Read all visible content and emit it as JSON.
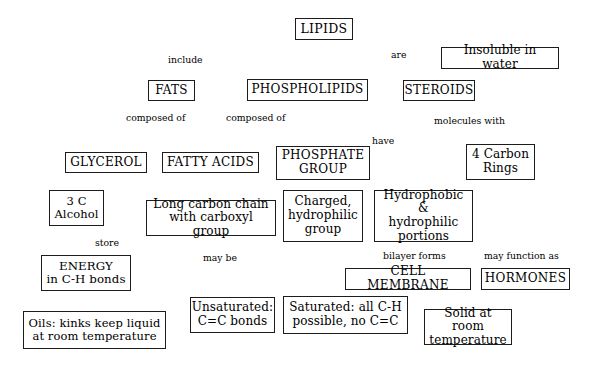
{
  "diagram": {
    "type": "concept-map",
    "canvas": {
      "width": 593,
      "height": 372
    },
    "style": {
      "background": "#ffffff",
      "stroke": "#1c1c1c",
      "text": "#000000"
    },
    "nodes": [
      {
        "id": "lipids",
        "label": "LIPIDS",
        "x": 295,
        "y": 18,
        "w": 58,
        "h": 22,
        "font": 12.5,
        "caps": true
      },
      {
        "id": "insoluble",
        "label": "Insoluble in water",
        "x": 441,
        "y": 47,
        "w": 118,
        "h": 22,
        "font": 12,
        "caps": false
      },
      {
        "id": "fats",
        "label": "FATS",
        "x": 148,
        "y": 80,
        "w": 47,
        "h": 21,
        "font": 12,
        "caps": true
      },
      {
        "id": "phospholipids",
        "label": "PHOSPHOLIPIDS",
        "x": 247,
        "y": 79,
        "w": 121,
        "h": 22,
        "font": 12,
        "caps": true
      },
      {
        "id": "steroids",
        "label": "STEROIDS",
        "x": 403,
        "y": 80,
        "w": 72,
        "h": 21,
        "font": 12,
        "caps": true
      },
      {
        "id": "glycerol",
        "label": "GLYCEROL",
        "x": 65,
        "y": 152,
        "w": 82,
        "h": 21,
        "font": 12,
        "caps": true
      },
      {
        "id": "fattyacids",
        "label": "FATTY ACIDS",
        "x": 162,
        "y": 152,
        "w": 97,
        "h": 21,
        "font": 12,
        "caps": true
      },
      {
        "id": "phosphate",
        "label": "PHOSPHATE\nGROUP",
        "x": 276,
        "y": 146,
        "w": 94,
        "h": 34,
        "font": 12,
        "caps": true
      },
      {
        "id": "fourcarbon",
        "label": "4 Carbon\nRings",
        "x": 466,
        "y": 144,
        "w": 69,
        "h": 36,
        "font": 12,
        "caps": false
      },
      {
        "id": "threec",
        "label": "3 C\nAlcohol",
        "x": 49,
        "y": 190,
        "w": 55,
        "h": 36,
        "font": 11.5,
        "caps": false
      },
      {
        "id": "longchain",
        "label": "Long carbon chain\nwith carboxyl group",
        "x": 146,
        "y": 200,
        "w": 130,
        "h": 36,
        "font": 12,
        "caps": false
      },
      {
        "id": "charged",
        "label": "Charged,\nhydrophilic\ngroup",
        "x": 283,
        "y": 190,
        "w": 80,
        "h": 52,
        "font": 12,
        "caps": false
      },
      {
        "id": "hydro",
        "label": "Hydrophobic &\nhydrophilic\nportions",
        "x": 374,
        "y": 190,
        "w": 99,
        "h": 52,
        "font": 12,
        "caps": false
      },
      {
        "id": "energy",
        "label": "ENERGY\nin C-H bonds",
        "x": 41,
        "y": 255,
        "w": 90,
        "h": 36,
        "font": 11.8,
        "caps": false
      },
      {
        "id": "cellmembrane",
        "label": "CELL MEMBRANE",
        "x": 345,
        "y": 268,
        "w": 126,
        "h": 22,
        "font": 12,
        "caps": true
      },
      {
        "id": "hormones",
        "label": "HORMONES",
        "x": 481,
        "y": 268,
        "w": 89,
        "h": 22,
        "font": 12,
        "caps": true
      },
      {
        "id": "unsaturated",
        "label": "Unsaturated:\nC=C bonds",
        "x": 190,
        "y": 297,
        "w": 85,
        "h": 36,
        "font": 12,
        "caps": false
      },
      {
        "id": "saturated",
        "label": "Saturated:  all C-H\npossible, no C=C",
        "x": 283,
        "y": 296,
        "w": 125,
        "h": 38,
        "font": 12,
        "caps": false
      },
      {
        "id": "oils",
        "label": "Oils: kinks keep liquid\nat room temperature",
        "x": 23,
        "y": 311,
        "w": 143,
        "h": 38,
        "font": 11.5,
        "caps": false
      },
      {
        "id": "solid",
        "label": "Solid at room\ntemperature",
        "x": 424,
        "y": 309,
        "w": 88,
        "h": 36,
        "font": 12,
        "caps": false
      }
    ],
    "edges": [
      {
        "id": "e1",
        "from": "lipids",
        "to": "fats",
        "label": "include",
        "points": "318,40 156,80"
      },
      {
        "id": "e2",
        "from": "lipids",
        "to": "phospholipids",
        "label": "",
        "points": "320,40 307,79"
      },
      {
        "id": "e3",
        "from": "lipids",
        "to": "steroids",
        "label": "",
        "points": "326,40 413,80"
      },
      {
        "id": "e4",
        "from": "lipids",
        "to": "insoluble",
        "label": "are",
        "points": "352,33 441,58"
      },
      {
        "id": "e5",
        "from": "fats",
        "to": "glycerol",
        "label": "composed of",
        "points": "166,101 103,152"
      },
      {
        "id": "e6",
        "from": "fats",
        "to": "fattyacids",
        "label": "",
        "points": "178,101 205,152"
      },
      {
        "id": "e7",
        "from": "phospholipids",
        "to": "glycerol",
        "label": "composed of",
        "points": "262,101 140,155"
      },
      {
        "id": "e8",
        "from": "phospholipids",
        "to": "fattyacids",
        "label": "",
        "points": "282,101 222,152"
      },
      {
        "id": "e9",
        "from": "phospholipids",
        "to": "phosphate",
        "label": "",
        "points": "308,101 317,146"
      },
      {
        "id": "e10",
        "from": "phospholipids",
        "to": "hydro",
        "label": "have",
        "points": "348,101 400,190"
      },
      {
        "id": "e11",
        "from": "steroids",
        "to": "fourcarbon",
        "label": "molecules with",
        "points": "440,101 489,144"
      },
      {
        "id": "e12",
        "from": "glycerol",
        "to": "threec",
        "label": "",
        "points": "85,173 79,190"
      },
      {
        "id": "e13",
        "from": "fattyacids",
        "to": "longchain",
        "label": "",
        "points": "208,173 209,200"
      },
      {
        "id": "e14",
        "from": "fattyacids",
        "to": "energy",
        "label": "store",
        "points": "170,173 97,255"
      },
      {
        "id": "e15",
        "from": "phosphate",
        "to": "charged",
        "label": "",
        "points": "317,180 318,190"
      },
      {
        "id": "e16",
        "from": "hydro",
        "to": "cellmembrane",
        "label": "bilayer forms",
        "points": "411,242 410,268"
      },
      {
        "id": "e17",
        "from": "fourcarbon",
        "to": "hormones",
        "label": "may function as",
        "points": "493,180 521,268"
      },
      {
        "id": "e18",
        "from": "longchain",
        "to": "unsaturated",
        "label": "may be",
        "points": "207,236 226,297"
      },
      {
        "id": "e19",
        "from": "longchain",
        "to": "saturated",
        "label": "",
        "points": "212,236 318,296"
      },
      {
        "id": "e20",
        "from": "unsaturated",
        "to": "oils",
        "label": "",
        "points": "190,318 166,327"
      },
      {
        "id": "e21",
        "from": "saturated",
        "to": "solid",
        "label": "",
        "points": "408,318 424,325"
      }
    ],
    "edge_labels": [
      {
        "id": "l-include",
        "text": "include",
        "x": 168,
        "y": 55
      },
      {
        "id": "l-are",
        "text": "are",
        "x": 391,
        "y": 50
      },
      {
        "id": "l-comp1",
        "text": "composed of",
        "x": 126,
        "y": 113
      },
      {
        "id": "l-comp2",
        "text": "composed of",
        "x": 226,
        "y": 113
      },
      {
        "id": "l-have",
        "text": "have",
        "x": 372,
        "y": 136
      },
      {
        "id": "l-molecules",
        "text": "molecules with",
        "x": 434,
        "y": 116
      },
      {
        "id": "l-store",
        "text": "store",
        "x": 95,
        "y": 238
      },
      {
        "id": "l-maybe",
        "text": "may be",
        "x": 203,
        "y": 253
      },
      {
        "id": "l-bilayer",
        "text": "bilayer forms",
        "x": 383,
        "y": 251
      },
      {
        "id": "l-function",
        "text": "may function as",
        "x": 484,
        "y": 251
      }
    ]
  }
}
